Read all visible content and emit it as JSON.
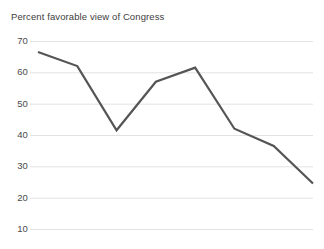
{
  "chart_data": {
    "type": "line",
    "title": "Percent favorable view of Congress",
    "xlabel": "",
    "ylabel": "",
    "ylim": [
      10,
      70
    ],
    "yticks": [
      70,
      60,
      50,
      40,
      30,
      20,
      10
    ],
    "ytick_labels": [
      "70",
      "60",
      "50",
      "40",
      "30",
      "20",
      "10"
    ],
    "grid": true,
    "grid_color": "#e2e2e2",
    "legend": null,
    "x": [
      0,
      1,
      2,
      3,
      4,
      5,
      6,
      7
    ],
    "values": [
      66.5,
      62,
      41.5,
      57,
      61.5,
      42,
      36.5,
      24.5
    ],
    "series": [
      {
        "name": "Percent favorable view of Congress",
        "values": [
          66.5,
          62,
          41.5,
          57,
          61.5,
          42,
          36.5,
          24.5
        ],
        "color": "#555555",
        "line_width": 2.2
      }
    ]
  },
  "colors": {
    "background": "#ffffff",
    "line": "#555555",
    "grid": "#e2e2e2",
    "text": "#3d3d3d",
    "tick_text": "#4a4a4a"
  }
}
